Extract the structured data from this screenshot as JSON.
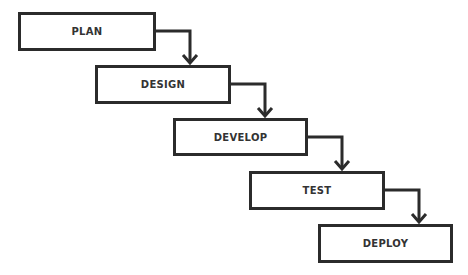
{
  "diagram": {
    "type": "waterfall",
    "stroke_color": "#2b2b2b",
    "text_color": "#333333",
    "stages": [
      {
        "label": "PLAN",
        "x": 18,
        "y": 12,
        "w": 138,
        "h": 39
      },
      {
        "label": "DESIGN",
        "x": 95,
        "y": 65,
        "w": 136,
        "h": 39
      },
      {
        "label": "DEVELOP",
        "x": 173,
        "y": 118,
        "w": 135,
        "h": 38
      },
      {
        "label": "TEST",
        "x": 249,
        "y": 171,
        "w": 136,
        "h": 39
      },
      {
        "label": "DEPLOY",
        "x": 318,
        "y": 224,
        "w": 135,
        "h": 39
      }
    ],
    "connectors": [
      {
        "from": "PLAN",
        "to": "DESIGN"
      },
      {
        "from": "DESIGN",
        "to": "DEVELOP"
      },
      {
        "from": "DEVELOP",
        "to": "TEST"
      },
      {
        "from": "TEST",
        "to": "DEPLOY"
      }
    ]
  }
}
